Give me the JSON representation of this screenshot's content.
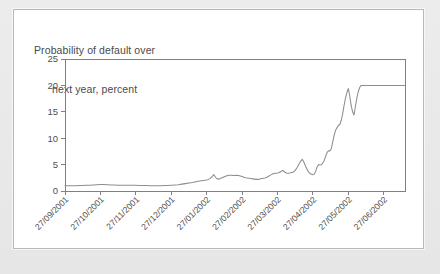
{
  "figure": {
    "title_line1": "Probability of default over",
    "title_line2": "next year, percent",
    "panel_background": "#ffffff",
    "page_background": "#e9e9e9",
    "border_color": "#b9b9b9"
  },
  "chart_data": {
    "type": "line",
    "title": "Probability of default over next year, percent",
    "xlabel": "",
    "ylabel": "Probability of default over next year, percent",
    "ylim": [
      0,
      25
    ],
    "yticks": [
      0,
      5,
      10,
      15,
      20,
      25
    ],
    "grid": false,
    "legend": "none",
    "line_color": "#8d8d8d",
    "axis_color": "#808080",
    "categories": [
      "27/09/2001",
      "27/10/2001",
      "27/11/2001",
      "27/12/2001",
      "27/01/2002",
      "27/02/2002",
      "27/03/2002",
      "27/04/2002",
      "27/05/2002",
      "27/06/2002"
    ],
    "xtick_labels": [
      "27/09/2001",
      "27/10/2001",
      "27/11/2001",
      "27/12/2001",
      "27/01/2002",
      "27/02/2002",
      "27/03/2002",
      "27/04/2002",
      "27/05/2002",
      "27/06/2002"
    ],
    "series": [
      {
        "name": "Probability of default",
        "x": [
          0.0,
          0.1,
          0.2,
          0.3,
          0.4,
          0.5,
          0.6,
          0.7,
          0.8,
          0.9,
          1.0,
          1.1,
          1.2,
          1.3,
          1.4,
          1.5,
          1.6,
          1.7,
          1.8,
          1.9,
          2.0,
          2.1,
          2.2,
          2.3,
          2.4,
          2.5,
          2.6,
          2.7,
          2.8,
          2.9,
          3.0,
          3.1,
          3.2,
          3.3,
          3.4,
          3.5,
          3.6,
          3.7,
          3.8,
          3.9,
          4.0,
          4.05,
          4.1,
          4.15,
          4.2,
          4.25,
          4.3,
          4.35,
          4.4,
          4.45,
          4.5,
          4.55,
          4.6,
          4.65,
          4.7,
          4.75,
          4.8,
          4.85,
          4.9,
          4.95,
          5.0,
          5.05,
          5.1,
          5.15,
          5.2,
          5.25,
          5.3,
          5.35,
          5.4,
          5.45,
          5.5,
          5.55,
          5.6,
          5.65,
          5.7,
          5.75,
          5.8,
          5.85,
          5.9,
          5.95,
          6.0,
          6.05,
          6.1,
          6.15,
          6.2,
          6.25,
          6.3,
          6.35,
          6.4,
          6.45,
          6.5,
          6.55,
          6.6,
          6.65,
          6.7,
          6.75,
          6.8,
          6.85,
          6.9,
          6.95,
          7.0,
          7.04,
          7.08,
          7.12,
          7.16,
          7.2,
          7.24,
          7.28,
          7.32,
          7.36,
          7.4,
          7.44,
          7.48,
          7.52,
          7.56,
          7.6,
          7.64,
          7.68,
          7.72,
          7.76,
          7.8,
          7.84,
          7.88,
          7.92,
          7.96,
          8.0,
          8.04,
          8.08,
          8.12,
          8.16,
          8.2,
          8.24,
          8.28,
          8.32,
          8.36,
          8.4,
          9.0,
          9.6
        ],
        "values": [
          1.0,
          1.0,
          1.0,
          1.0,
          1.05,
          1.05,
          1.1,
          1.1,
          1.15,
          1.2,
          1.25,
          1.25,
          1.2,
          1.15,
          1.15,
          1.1,
          1.1,
          1.1,
          1.1,
          1.1,
          1.1,
          1.05,
          1.05,
          1.05,
          1.0,
          1.0,
          1.0,
          1.0,
          1.05,
          1.05,
          1.1,
          1.15,
          1.2,
          1.3,
          1.4,
          1.5,
          1.6,
          1.75,
          1.9,
          2.0,
          2.1,
          2.2,
          2.4,
          2.7,
          3.1,
          2.6,
          2.3,
          2.25,
          2.4,
          2.55,
          2.7,
          2.85,
          2.95,
          3.0,
          3.0,
          2.95,
          2.95,
          3.0,
          2.95,
          2.85,
          2.75,
          2.6,
          2.5,
          2.45,
          2.4,
          2.35,
          2.3,
          2.25,
          2.2,
          2.2,
          2.25,
          2.35,
          2.4,
          2.45,
          2.6,
          2.8,
          3.0,
          3.2,
          3.3,
          3.35,
          3.4,
          3.5,
          3.7,
          3.9,
          3.6,
          3.4,
          3.35,
          3.4,
          3.5,
          3.6,
          3.9,
          4.4,
          5.0,
          5.6,
          6.0,
          5.4,
          4.6,
          3.9,
          3.4,
          3.2,
          3.1,
          3.2,
          3.8,
          4.6,
          5.0,
          4.9,
          5.0,
          5.3,
          5.8,
          6.6,
          7.3,
          7.6,
          7.6,
          8.0,
          9.3,
          10.6,
          11.5,
          12.0,
          12.4,
          12.6,
          13.4,
          14.6,
          16.2,
          17.6,
          18.7,
          19.4,
          18.0,
          16.2,
          15.0,
          14.4,
          16.0,
          17.6,
          18.8,
          19.6,
          20.0,
          20.0,
          20.0,
          20.0
        ]
      }
    ]
  },
  "axes": {
    "y_tick_labels": [
      "0",
      "5",
      "10",
      "15",
      "20",
      "25"
    ]
  }
}
